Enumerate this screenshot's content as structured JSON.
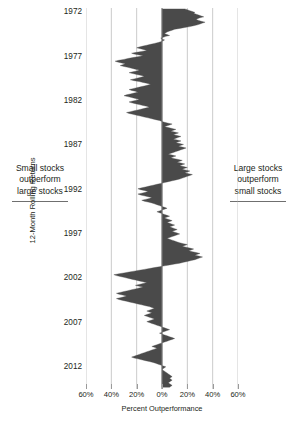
{
  "annotations": {
    "left": {
      "line1": "Small stocks",
      "line2": "outperform",
      "line3": "large stocks"
    },
    "right": {
      "line1": "Large stocks",
      "line2": "outperform",
      "line3": "small stocks"
    }
  },
  "colors": {
    "series_fill": "#4a4a4a",
    "gridline": "#b4b4b4",
    "zero_line": "#8c8c8c",
    "text": "#231f20",
    "background": "#ffffff"
  },
  "chart_data": {
    "type": "area",
    "title": "",
    "subtitle": "",
    "orientation": "horizontal",
    "xlabel": "Percent Outperformance",
    "ylabel": "12-Month Rolling Returns",
    "grid": true,
    "legend": null,
    "xlim": [
      -60,
      60
    ],
    "xticks": [
      -60,
      -40,
      -20,
      0,
      20,
      40,
      60
    ],
    "xtick_labels": [
      "60%",
      "40%",
      "20%",
      "0%",
      "20%",
      "40%",
      "60%"
    ],
    "ylim": [
      1971.5,
      2014.5
    ],
    "yticks": [
      1972,
      1977,
      1982,
      1987,
      1992,
      1997,
      2002,
      2007,
      2012
    ],
    "ytick_labels": [
      "1972",
      "1977",
      "1982",
      "1987",
      "1992",
      "1997",
      "2002",
      "2007",
      "2012"
    ],
    "zero_reference": 0,
    "x": [
      1971.6,
      1971.7,
      1971.8,
      1971.9,
      1972.0,
      1972.1,
      1972.2,
      1972.3,
      1972.4,
      1972.5,
      1972.6,
      1972.7,
      1972.8,
      1972.9,
      1973.0,
      1973.1,
      1973.2,
      1973.3,
      1973.4,
      1973.5,
      1973.6,
      1973.7,
      1973.8,
      1973.9,
      1974.0,
      1974.1,
      1974.2,
      1974.3,
      1974.4,
      1974.5,
      1974.6,
      1974.7,
      1974.8,
      1974.9,
      1975.0,
      1975.1,
      1975.2,
      1975.3,
      1975.4,
      1975.5,
      1975.6,
      1975.7,
      1975.8,
      1975.9,
      1976.0,
      1976.1,
      1976.2,
      1976.3,
      1976.4,
      1976.5,
      1976.6,
      1976.7,
      1976.8,
      1976.9,
      1977.0,
      1977.1,
      1977.2,
      1977.3,
      1977.4,
      1977.5,
      1977.6,
      1977.7,
      1977.8,
      1977.9,
      1978.0,
      1978.1,
      1978.2,
      1978.3,
      1978.4,
      1978.5,
      1978.6,
      1978.7,
      1978.8,
      1978.9,
      1979.0,
      1979.1,
      1979.2,
      1979.3,
      1979.4,
      1979.5,
      1979.6,
      1979.7,
      1979.8,
      1979.9,
      1980.0,
      1980.1,
      1980.2,
      1980.3,
      1980.4,
      1980.5,
      1980.6,
      1980.7,
      1980.8,
      1980.9,
      1981.0,
      1981.1,
      1981.2,
      1981.3,
      1981.4,
      1981.5,
      1981.6,
      1981.7,
      1981.8,
      1981.9,
      1982.0,
      1982.1,
      1982.2,
      1982.3,
      1982.4,
      1982.5,
      1982.6,
      1982.7,
      1982.8,
      1982.9,
      1983.0,
      1983.1,
      1983.2,
      1983.3,
      1983.4,
      1983.5,
      1983.6,
      1983.7,
      1983.8,
      1983.9,
      1984.0,
      1984.1,
      1984.2,
      1984.3,
      1984.4,
      1984.5,
      1984.6,
      1984.7,
      1984.8,
      1984.9,
      1985.0,
      1985.1,
      1985.2,
      1985.3,
      1985.4,
      1985.5,
      1985.6,
      1985.7,
      1985.8,
      1985.9,
      1986.0,
      1986.1,
      1986.2,
      1986.3,
      1986.4,
      1986.5,
      1986.6,
      1986.7,
      1986.8,
      1986.9,
      1987.0,
      1987.1,
      1987.2,
      1987.3,
      1987.4,
      1987.5,
      1987.6,
      1987.7,
      1987.8,
      1987.9,
      1988.0,
      1988.1,
      1988.2,
      1988.3,
      1988.4,
      1988.5,
      1988.6,
      1988.7,
      1988.8,
      1988.9,
      1989.0,
      1989.1,
      1989.2,
      1989.3,
      1989.4,
      1989.5,
      1989.6,
      1989.7,
      1989.8,
      1989.9,
      1990.0,
      1990.1,
      1990.2,
      1990.3,
      1990.4,
      1990.5,
      1990.6,
      1990.7,
      1990.8,
      1990.9,
      1991.0,
      1991.1,
      1991.2,
      1991.3,
      1991.4,
      1991.5,
      1991.6,
      1991.7,
      1991.8,
      1991.9,
      1992.0,
      1992.1,
      1992.2,
      1992.3,
      1992.4,
      1992.5,
      1992.6,
      1992.7,
      1992.8,
      1992.9,
      1993.0,
      1993.1,
      1993.2,
      1993.3,
      1993.4,
      1993.5,
      1993.6,
      1993.7,
      1993.8,
      1993.9,
      1994.0,
      1994.1,
      1994.2,
      1994.3,
      1994.4,
      1994.5,
      1994.6,
      1994.7,
      1994.8,
      1994.9,
      1995.0,
      1995.1,
      1995.2,
      1995.3,
      1995.4,
      1995.5,
      1995.6,
      1995.7,
      1995.8,
      1995.9,
      1996.0,
      1996.1,
      1996.2,
      1996.3,
      1996.4,
      1996.5,
      1996.6,
      1996.7,
      1996.8,
      1996.9,
      1997.0,
      1997.1,
      1997.2,
      1997.3,
      1997.4,
      1997.5,
      1997.6,
      1997.7,
      1997.8,
      1997.9,
      1998.0,
      1998.1,
      1998.2,
      1998.3,
      1998.4,
      1998.5,
      1998.6,
      1998.7,
      1998.8,
      1998.9,
      1999.0,
      1999.1,
      1999.2,
      1999.3,
      1999.4,
      1999.5,
      1999.6,
      1999.7,
      1999.8,
      1999.9,
      2000.0,
      2000.1,
      2000.2,
      2000.3,
      2000.4,
      2000.5,
      2000.6,
      2000.7,
      2000.8,
      2000.9,
      2001.0,
      2001.1,
      2001.2,
      2001.3,
      2001.4,
      2001.5,
      2001.6,
      2001.7,
      2001.8,
      2001.9,
      2002.0,
      2002.1,
      2002.2,
      2002.3,
      2002.4,
      2002.5,
      2002.6,
      2002.7,
      2002.8,
      2002.9,
      2003.0,
      2003.1,
      2003.2,
      2003.3,
      2003.4,
      2003.5,
      2003.6,
      2003.7,
      2003.8,
      2003.9,
      2004.0,
      2004.1,
      2004.2,
      2004.3,
      2004.4,
      2004.5,
      2004.6,
      2004.7,
      2004.8,
      2004.9,
      2005.0,
      2005.1,
      2005.2,
      2005.3,
      2005.4,
      2005.5,
      2005.6,
      2005.7,
      2005.8,
      2005.9,
      2006.0,
      2006.1,
      2006.2,
      2006.3,
      2006.4,
      2006.5,
      2006.6,
      2006.7,
      2006.8,
      2006.9,
      2007.0,
      2007.1,
      2007.2,
      2007.3,
      2007.4,
      2007.5,
      2007.6,
      2007.7,
      2007.8,
      2007.9,
      2008.0,
      2008.1,
      2008.2,
      2008.3,
      2008.4,
      2008.5,
      2008.6,
      2008.7,
      2008.8,
      2008.9,
      2009.0,
      2009.1,
      2009.2,
      2009.3,
      2009.4,
      2009.5,
      2009.6,
      2009.7,
      2009.8,
      2009.9,
      2010.0,
      2010.1,
      2010.2,
      2010.3,
      2010.4,
      2010.5,
      2010.6,
      2010.7,
      2010.8,
      2010.9,
      2011.0,
      2011.1,
      2011.2,
      2011.3,
      2011.4,
      2011.5,
      2011.6,
      2011.7,
      2011.8,
      2011.9,
      2012.0,
      2012.1,
      2012.2,
      2012.3,
      2012.4,
      2012.5,
      2012.6,
      2012.7,
      2012.8,
      2012.9,
      2013.0,
      2013.1,
      2013.2,
      2013.3,
      2013.4,
      2013.5,
      2013.6,
      2013.7,
      2013.8,
      2013.9,
      2014.0,
      2014.1,
      2014.2,
      2014.3
    ],
    "values": [
      18,
      20,
      22,
      24,
      26,
      25,
      27,
      29,
      31,
      33,
      30,
      28,
      27,
      29,
      31,
      34,
      32,
      30,
      28,
      25,
      22,
      18,
      14,
      10,
      8,
      6,
      4,
      3,
      2,
      4,
      6,
      3,
      1,
      -1,
      0,
      2,
      1,
      -1,
      -3,
      -6,
      -9,
      -12,
      -15,
      -18,
      -20,
      -17,
      -14,
      -12,
      -16,
      -20,
      -24,
      -22,
      -18,
      -15,
      -19,
      -23,
      -27,
      -30,
      -34,
      -37,
      -35,
      -32,
      -29,
      -31,
      -33,
      -30,
      -27,
      -24,
      -21,
      -18,
      -20,
      -23,
      -26,
      -23,
      -20,
      -17,
      -14,
      -16,
      -19,
      -22,
      -25,
      -22,
      -18,
      -15,
      -12,
      -9,
      -11,
      -14,
      -17,
      -20,
      -23,
      -26,
      -24,
      -21,
      -19,
      -22,
      -25,
      -28,
      -30,
      -27,
      -24,
      -21,
      -18,
      -20,
      -23,
      -26,
      -24,
      -21,
      -18,
      -15,
      -12,
      -10,
      -13,
      -16,
      -19,
      -22,
      -25,
      -28,
      -26,
      -23,
      -20,
      -17,
      -14,
      -11,
      -8,
      -5,
      -2,
      0,
      2,
      5,
      8,
      6,
      4,
      2,
      5,
      8,
      11,
      9,
      7,
      10,
      13,
      11,
      9,
      12,
      15,
      13,
      11,
      9,
      12,
      15,
      13,
      11,
      14,
      17,
      15,
      13,
      16,
      19,
      17,
      15,
      13,
      11,
      9,
      7,
      5,
      8,
      11,
      9,
      7,
      10,
      13,
      16,
      14,
      12,
      15,
      18,
      16,
      14,
      17,
      20,
      18,
      16,
      19,
      22,
      20,
      18,
      21,
      24,
      22,
      20,
      18,
      16,
      14,
      11,
      8,
      5,
      2,
      -1,
      -4,
      -7,
      -10,
      -13,
      -16,
      -19,
      -17,
      -14,
      -11,
      -13,
      -16,
      -19,
      -17,
      -14,
      -11,
      -8,
      -10,
      -13,
      -16,
      -14,
      -11,
      -8,
      -6,
      -4,
      -2,
      0,
      2,
      4,
      2,
      0,
      -2,
      -4,
      -2,
      0,
      2,
      4,
      6,
      4,
      2,
      4,
      6,
      8,
      6,
      4,
      6,
      8,
      10,
      8,
      6,
      8,
      10,
      12,
      10,
      8,
      10,
      12,
      14,
      12,
      10,
      8,
      6,
      4,
      6,
      8,
      10,
      12,
      14,
      17,
      20,
      18,
      16,
      19,
      22,
      25,
      23,
      21,
      24,
      27,
      30,
      28,
      26,
      29,
      32,
      30,
      28,
      26,
      23,
      20,
      17,
      14,
      10,
      6,
      2,
      -2,
      -6,
      -10,
      -14,
      -18,
      -22,
      -26,
      -30,
      -34,
      -38,
      -36,
      -33,
      -30,
      -27,
      -24,
      -21,
      -18,
      -15,
      -12,
      -15,
      -18,
      -21,
      -18,
      -15,
      -18,
      -21,
      -24,
      -27,
      -30,
      -33,
      -36,
      -34,
      -31,
      -28,
      -30,
      -33,
      -36,
      -34,
      -31,
      -28,
      -25,
      -22,
      -19,
      -16,
      -13,
      -10,
      -8,
      -6,
      -8,
      -10,
      -12,
      -10,
      -8,
      -10,
      -12,
      -14,
      -12,
      -10,
      -8,
      -6,
      -8,
      -10,
      -12,
      -10,
      -8,
      -6,
      -4,
      -2,
      0,
      2,
      4,
      6,
      4,
      2,
      0,
      -2,
      0,
      2,
      4,
      6,
      8,
      10,
      8,
      6,
      4,
      2,
      0,
      -2,
      -4,
      -6,
      -8,
      -6,
      -4,
      -6,
      -8,
      -10,
      -12,
      -14,
      -16,
      -18,
      -20,
      -22,
      -24,
      -22,
      -19,
      -16,
      -13,
      -10,
      -7,
      -5,
      -3,
      -1,
      1,
      3,
      2,
      1,
      0,
      1,
      2,
      3,
      4,
      5,
      6,
      7,
      8,
      7,
      6,
      7,
      8,
      7,
      6,
      5,
      6,
      7,
      8,
      7,
      6
    ]
  }
}
